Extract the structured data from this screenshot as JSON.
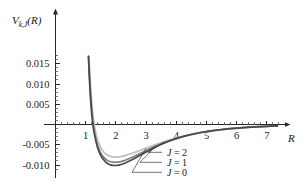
{
  "chart_data": {
    "type": "line",
    "title": "",
    "subtitle": "",
    "xlabel": "R",
    "ylabel": "V_{k,J}(R)",
    "ylabel_base": "V",
    "ylabel_sub": "k,J",
    "ylabel_arg": "(R)",
    "xlim": [
      0.0,
      7.55
    ],
    "ylim": [
      -0.0122,
      0.0185
    ],
    "grid": false,
    "legend_position": "inside-lower-right",
    "x_ticks_major": [
      1,
      2,
      3,
      4,
      5,
      6,
      7
    ],
    "x_tick_labels": [
      "1",
      "2",
      "3",
      "4",
      "5",
      "6",
      "7"
    ],
    "x_minor_step": 0.2,
    "y_ticks_major": [
      0.015,
      0.01,
      0.005,
      -0.005,
      -0.01
    ],
    "y_tick_labels": [
      "0.015",
      "0.010",
      "0.005",
      "-0.005",
      "-0.010"
    ],
    "y_zero_unlabeled": true,
    "axis_arrow_x": true,
    "axis_arrow_y": true,
    "series": [
      {
        "name": "J = 0",
        "label_prefix": "J",
        "label_eq": "=",
        "label_value": "0",
        "color": "#4a4a4a",
        "width": 1.7,
        "minimum_R": 2.0,
        "minimum_V": -0.0101,
        "zero_crossing_R": 1.2,
        "points": [
          [
            1.09,
            0.0168
          ],
          [
            1.1,
            0.015
          ],
          [
            1.115,
            0.0125
          ],
          [
            1.13,
            0.0102
          ],
          [
            1.15,
            0.0075
          ],
          [
            1.17,
            0.0053
          ],
          [
            1.19,
            0.0034
          ],
          [
            1.21,
            0.0018
          ],
          [
            1.23,
            0.00045
          ],
          [
            1.26,
            -0.00115
          ],
          [
            1.3,
            -0.00283
          ],
          [
            1.34,
            -0.00422
          ],
          [
            1.39,
            -0.0056
          ],
          [
            1.45,
            -0.00686
          ],
          [
            1.52,
            -0.00793
          ],
          [
            1.6,
            -0.00878
          ],
          [
            1.7,
            -0.0095
          ],
          [
            1.8,
            -0.00992
          ],
          [
            1.9,
            -0.01009
          ],
          [
            2.0,
            -0.01012
          ],
          [
            2.1,
            -0.01002
          ],
          [
            2.2,
            -0.00981
          ],
          [
            2.35,
            -0.00937
          ],
          [
            2.5,
            -0.00884
          ],
          [
            2.7,
            -0.00803
          ],
          [
            2.9,
            -0.0072
          ],
          [
            3.1,
            -0.00639
          ],
          [
            3.3,
            -0.00562
          ],
          [
            3.55,
            -0.00475
          ],
          [
            3.8,
            -0.004
          ],
          [
            4.05,
            -0.00336
          ],
          [
            4.3,
            -0.00282
          ],
          [
            4.6,
            -0.00229
          ],
          [
            4.9,
            -0.00186
          ],
          [
            5.2,
            -0.00152
          ],
          [
            5.5,
            -0.00124
          ],
          [
            5.85,
            -0.00098
          ],
          [
            6.2,
            -0.00077
          ],
          [
            6.6,
            -0.00058
          ],
          [
            7.0,
            -0.00044
          ],
          [
            7.35,
            -0.00034
          ]
        ]
      },
      {
        "name": "J = 1",
        "label_prefix": "J",
        "label_eq": "=",
        "label_value": "1",
        "color": "#7d7d7d",
        "width": 1.7,
        "minimum_R": 2.02,
        "minimum_V": -0.0093,
        "zero_crossing_R": 1.215,
        "points": [
          [
            1.095,
            0.0168
          ],
          [
            1.11,
            0.0147
          ],
          [
            1.125,
            0.0122
          ],
          [
            1.145,
            0.0097
          ],
          [
            1.165,
            0.0072
          ],
          [
            1.185,
            0.0051
          ],
          [
            1.205,
            0.0032
          ],
          [
            1.225,
            0.0016
          ],
          [
            1.245,
            0.00025
          ],
          [
            1.275,
            -0.00125
          ],
          [
            1.315,
            -0.00282
          ],
          [
            1.355,
            -0.00412
          ],
          [
            1.405,
            -0.0054
          ],
          [
            1.465,
            -0.00655
          ],
          [
            1.535,
            -0.00751
          ],
          [
            1.615,
            -0.00826
          ],
          [
            1.715,
            -0.00886
          ],
          [
            1.815,
            -0.00919
          ],
          [
            1.915,
            -0.00931
          ],
          [
            2.02,
            -0.00932
          ],
          [
            2.12,
            -0.00922
          ],
          [
            2.22,
            -0.00903
          ],
          [
            2.37,
            -0.00863
          ],
          [
            2.52,
            -0.00816
          ],
          [
            2.72,
            -0.00745
          ],
          [
            2.92,
            -0.00673
          ],
          [
            3.12,
            -0.00601
          ],
          [
            3.32,
            -0.00533
          ],
          [
            3.57,
            -0.00455
          ],
          [
            3.82,
            -0.00387
          ],
          [
            4.07,
            -0.00328
          ],
          [
            4.32,
            -0.00278
          ],
          [
            4.62,
            -0.00228
          ],
          [
            4.92,
            -0.00186
          ],
          [
            5.22,
            -0.00153
          ],
          [
            5.52,
            -0.00125
          ],
          [
            5.87,
            -0.00099
          ],
          [
            6.22,
            -0.00078
          ],
          [
            6.62,
            -0.00059
          ],
          [
            7.0,
            -0.00045
          ],
          [
            7.35,
            -0.00034
          ]
        ]
      },
      {
        "name": "J = 2",
        "label_prefix": "J",
        "label_eq": "=",
        "label_value": "2",
        "color": "#c2c2c2",
        "width": 1.9,
        "minimum_R": 2.06,
        "minimum_V": -0.008,
        "zero_crossing_R": 1.245,
        "points": [
          [
            1.105,
            0.0168
          ],
          [
            1.12,
            0.0146
          ],
          [
            1.14,
            0.0119
          ],
          [
            1.16,
            0.0095
          ],
          [
            1.18,
            0.0072
          ],
          [
            1.2,
            0.0052
          ],
          [
            1.225,
            0.0032
          ],
          [
            1.25,
            0.00155
          ],
          [
            1.275,
            0.0002
          ],
          [
            1.31,
            -0.00122
          ],
          [
            1.35,
            -0.00262
          ],
          [
            1.395,
            -0.00382
          ],
          [
            1.45,
            -0.00493
          ],
          [
            1.515,
            -0.00592
          ],
          [
            1.59,
            -0.00673
          ],
          [
            1.675,
            -0.00733
          ],
          [
            1.775,
            -0.00776
          ],
          [
            1.875,
            -0.00797
          ],
          [
            1.975,
            -0.00804
          ],
          [
            2.06,
            -0.00803
          ],
          [
            2.16,
            -0.00793
          ],
          [
            2.28,
            -0.00772
          ],
          [
            2.42,
            -0.0074
          ],
          [
            2.58,
            -0.00699
          ],
          [
            2.78,
            -0.00645
          ],
          [
            2.98,
            -0.0059
          ],
          [
            3.18,
            -0.00535
          ],
          [
            3.38,
            -0.00481
          ],
          [
            3.62,
            -0.00421
          ],
          [
            3.88,
            -0.00363
          ],
          [
            4.13,
            -0.00312
          ],
          [
            4.38,
            -0.00267
          ],
          [
            4.68,
            -0.00221
          ],
          [
            4.98,
            -0.00182
          ],
          [
            5.28,
            -0.0015
          ],
          [
            5.58,
            -0.00123
          ],
          [
            5.92,
            -0.00098
          ],
          [
            6.28,
            -0.00077
          ],
          [
            6.65,
            -0.00059
          ],
          [
            7.02,
            -0.00045
          ],
          [
            7.35,
            -0.00034
          ]
        ]
      }
    ]
  },
  "axes": {
    "x_axis_name": "R",
    "y_axis_name": "V"
  }
}
